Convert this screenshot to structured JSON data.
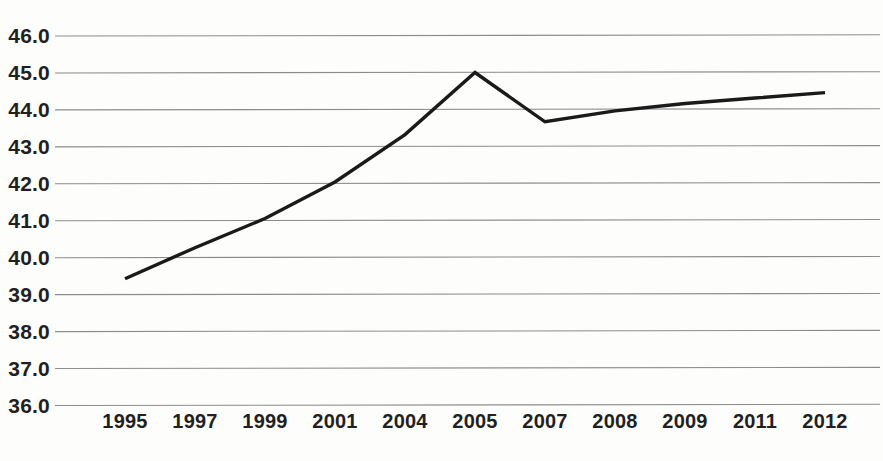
{
  "chart_data": {
    "type": "line",
    "title": "",
    "subtitle": "",
    "xlabel": "",
    "ylabel": "",
    "categories": [
      "1995",
      "1997",
      "1999",
      "2001",
      "2004",
      "2005",
      "2007",
      "2008",
      "2009",
      "2011",
      "2012"
    ],
    "values": [
      39.35,
      40.2,
      41.0,
      42.0,
      43.3,
      45.0,
      43.65,
      43.95,
      44.15,
      44.3,
      44.45
    ],
    "series": [
      {
        "name": "",
        "values": [
          39.35,
          40.2,
          41.0,
          42.0,
          43.3,
          45.0,
          43.65,
          43.95,
          44.15,
          44.3,
          44.45
        ]
      }
    ],
    "ylim": [
      36.0,
      46.0
    ],
    "ytick_values": [
      46.0,
      45.0,
      44.0,
      43.0,
      42.0,
      41.0,
      40.0,
      39.0,
      38.0,
      37.0,
      36.0
    ],
    "ytick_labels": [
      "46.0",
      "45.0",
      "44.0",
      "43.0",
      "42.0",
      "41.0",
      "40.0",
      "39.0",
      "38.0",
      "37.0",
      "36.0"
    ],
    "grid": true,
    "grid_axis": "y",
    "legend": false,
    "legend_position": "none",
    "annotations": [],
    "colors": {
      "line": "#1a1a1a",
      "grid": "#8c8c8c",
      "text": "#231f1e",
      "background": "#fdfdfc"
    }
  }
}
